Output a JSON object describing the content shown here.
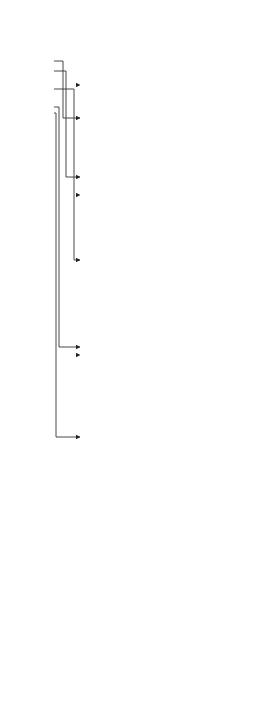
{
  "diagram": {
    "root": {
      "title": "Jet Fuel Saving"
    },
    "branches": [
      {
        "id": "flight_profile",
        "title": "Flight Profile Optimisation",
        "note": "(out of scope: Air carriers, Direct routing, vertical profile...)"
      },
      {
        "id": "power_plant",
        "title": "Increase power plant efficiency (11%)",
        "note": "(out of scope: Boeing/Airbus)"
      },
      {
        "id": "efficient_braking",
        "title": "Efficient Braking",
        "note": "(out of scope: Boeing/Airbus e.g. reduced thrust reverse)"
      },
      {
        "id": "operational",
        "title": "Operational procedures",
        "note": "(out of scope: Air Traffic Management Authorities e.g. reduced engine taxi)"
      },
      {
        "id": "aerodynamic",
        "title": "Aerodynamic optimisation (4%)",
        "note": "(out of scope: Boeing/Airbus)"
      },
      {
        "id": "maintenance",
        "title": "Maintenance costs optimisation (5%)",
        "note": "(out of scope: Boeing/Airbus)"
      }
    ],
    "power_plant_children": [
      {
        "id": "bypass",
        "title": "Increase Bypass ratio",
        "note": "(out of scope: CFM/RR)"
      },
      {
        "id": "weight",
        "title": "Weight reduction (Lower SFC)",
        "note": ""
      },
      {
        "id": "fan",
        "title": "Increase Fan diameter",
        "note": "(out of scope: CFM/RR)"
      }
    ],
    "weight_children": [
      {
        "id": "advanced_materials",
        "title": "Advanced materials",
        "note": "(out of scope: CFM/RR)"
      },
      {
        "id": "avionics_weight",
        "title": "Avionics",
        "note": "(in scope: short cables/harnesses, high temp electronics, more electrical systems)"
      }
    ],
    "maintenance_children": [
      {
        "id": "scheduled",
        "title": "Scheduled maintenance (3%)",
        "note": "(out of scope: Boeing/Airbus)"
      },
      {
        "id": "avionics_maint",
        "title": "Avionics (2%)",
        "note": "(in scope: pneumatic controls replaced by full electrical systems, high temp electronics)"
      }
    ]
  },
  "caption": {
    "label": "Figure 1.1",
    "text": "Aero engine fuel saving scheme based on [5, 6]."
  }
}
